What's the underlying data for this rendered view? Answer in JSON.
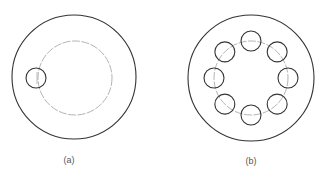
{
  "figures": [
    {
      "id": "a",
      "label": "(a)",
      "outer": {
        "cx": 74,
        "cy": 77,
        "r": 62
      },
      "ring": {
        "cx": 75,
        "cy": 78,
        "r": 37
      },
      "small_circles": [
        {
          "cx": 36,
          "cy": 78,
          "r": 10
        }
      ]
    },
    {
      "id": "b",
      "label": "(b)",
      "outer": {
        "cx": 251,
        "cy": 78,
        "r": 63
      },
      "ring": {
        "cx": 251,
        "cy": 78,
        "r": 37
      },
      "small_circles_count": 8,
      "small_radius": 10
    }
  ],
  "colors": {
    "stroke": "#333333",
    "dashed": "#999999"
  }
}
